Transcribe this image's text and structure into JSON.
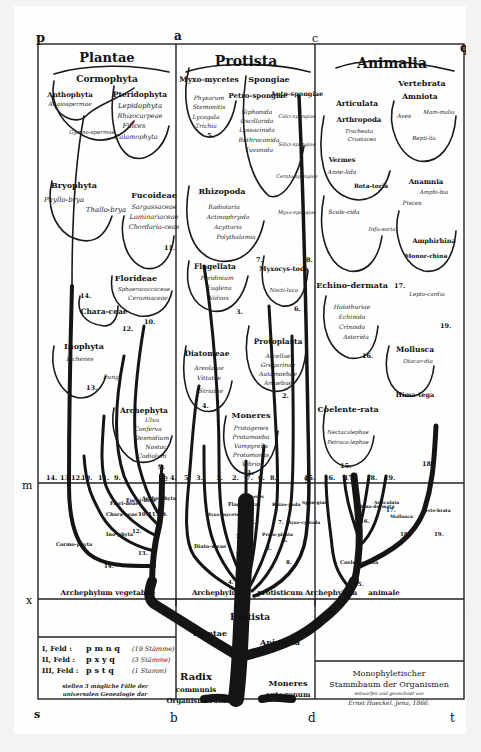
{
  "title": {
    "line1": "Monophyletischer",
    "line2": "Stammbaum der Organismen",
    "line3": "entworfen und gezeichnet von",
    "line4": "Ernst Haeckel. Jena, 1866."
  },
  "corners": {
    "p": "p",
    "a": "a",
    "c": "c",
    "q": "q",
    "m": "m",
    "e": "e",
    "g": "g",
    "n": "n",
    "x": "x",
    "f": "f",
    "h": "h",
    "y": "y",
    "s": "s",
    "b": "b",
    "d": "d",
    "t": "t"
  },
  "kingdoms": {
    "plantae": "Plantae",
    "protista": "Protista",
    "animalia": "Animalia"
  },
  "plantae_groups": {
    "cormophyta": "Cormophyta",
    "anthophyta": "Anthophyta",
    "angiospermae": "Angiospermae",
    "gymnospermae": "Gymno-spermae",
    "pteridophyta": "Pteridophyta",
    "pteridophyta_members": [
      "Lepidophyta",
      "Rhizocarpeae",
      "Filices",
      "Calamophyta"
    ],
    "bryophyta": "Bryophyta",
    "phyllobrya": "Phyllo-brya",
    "thallobrya": "Thallo-brya",
    "fucoideae": "Fucoideae",
    "fucoideae_members": [
      "Sargassaceae",
      "Laminariaceae",
      "Chordaria-ceae"
    ],
    "florideae": "Florideae",
    "florideae_members": [
      "Sphaerococcaceae",
      "Ceramiaceae"
    ],
    "characeae": "Chara-ceae",
    "inophyta": "Inophyta",
    "lichenes": "Lichenes",
    "fungi": "Fungi",
    "archephyta": "Archephyta",
    "archephyta_members": [
      "Ulva",
      "Conferva",
      "Desmidium",
      "Nostoc",
      "Codiolum"
    ]
  },
  "protista_groups": {
    "myxomycetes": "Myxo-mycetes",
    "myxomycetes_members": [
      "Physarum",
      "Stemonitis",
      "Lycogala",
      "Trichia"
    ],
    "spongiae": "Spongiae",
    "petrospongiae": "Petro-spongiae",
    "petrospongiae_members": [
      "Siphonida",
      "Oscillarida",
      "Lyssacinida",
      "Bothroconida",
      "Tuvonida"
    ],
    "autospongiae": "Auto-spongiae",
    "autospongiae_members": [
      "Calci-spongiae",
      "Silici-spongiae",
      "Cerato-spongiae",
      "Myxo-spongiae"
    ],
    "rhizopoda": "Rhizopoda",
    "rhizopoda_members": [
      "Radiolaria",
      "Actinophryida",
      "Acyttaria",
      "Polythalamia"
    ],
    "flagellata": "Flagellata",
    "flagellata_members": [
      "Peridinium",
      "Euglena",
      "Volvox"
    ],
    "myxocystoda": "Myxocys-toda",
    "myxocystoda_members": [
      "Nocti-luca"
    ],
    "diatomeae": "Diatomeae",
    "diatomeae_members": [
      "Areolatae",
      "Vittatae",
      "Striatae"
    ],
    "protoplasta": "Protoplasta",
    "protoplasta_members": [
      "Arcellae",
      "Gregarinae",
      "Autamoebae",
      "Amoebae"
    ],
    "moneres": "Moneres",
    "moneres_members": [
      "Protogenes",
      "Protamoeba",
      "Vampyrella",
      "Protomonas",
      "Vibrio"
    ]
  },
  "animalia_groups": {
    "vertebrata": "Vertebrata",
    "amniota": "Amniota",
    "aves": "Aves",
    "mammalia": "Mam-malia",
    "reptilia": "Repti-lia",
    "anamnia": "Anamnia",
    "amphibia": "Amphi-bia",
    "pisces": "Pisces",
    "amphirhina": "Amphirhina",
    "monorhina": "Monor-rhina",
    "leptocardia": "Lepto-cardia",
    "articulata": "Articulata",
    "arthropoda": "Arthropoda",
    "arthropoda_members": [
      "Tracheata",
      "Crustacea"
    ],
    "vermes": "Vermes",
    "annelida": "Anne-lida",
    "rotatoria": "Rota-toria",
    "scolecida": "Scole-cida",
    "infusoria": "Infu-soria",
    "echinodermata": "Echino-dermata",
    "echinodermata_members": [
      "Holothuriae",
      "Echinida",
      "Crinoida",
      "Asterida"
    ],
    "mollusca": "Mollusca",
    "otocardia": "Otocar-dia",
    "himatega": "Hima-tega",
    "coelenterata": "Coelente-rata",
    "coelenterata_members": [
      "Nectacalephae",
      "Petraca-lephae"
    ]
  },
  "group_numbers": {
    "myxomycetes": "5.",
    "rhizopoda": "7.",
    "spongiae": "8.",
    "flagellata": "3.",
    "myxocystoda": "6.",
    "diatomeae": "4.",
    "protoplasta": "2.",
    "moneres": "1.",
    "fucoideae": "11.",
    "florideae": "10.",
    "characeae": "12.",
    "inophyta": "13.",
    "cormophyta": "14.",
    "archephyta": "9.",
    "echinodermata": "16.",
    "articulata": "17.",
    "mollusca": "18.",
    "vertebrata": "19.",
    "coelenterata": "15."
  },
  "mn_line_numbers": [
    "14.",
    "13.",
    "12.",
    "10.",
    "11.",
    "9.",
    "4.",
    "5.",
    "3.",
    "1.",
    "2.",
    "7.",
    "6.",
    "8.",
    "15.",
    "16.",
    "17.",
    "18.",
    "19."
  ],
  "lower_field_labels": {
    "plantae": [
      "Flori-deae",
      "Fucoi-deae",
      "Arche-phyta",
      "Chara-ceae",
      "Ino-phyta",
      "Cormo-phyta"
    ],
    "plantae_nums": [
      "10.",
      "11.",
      "9.",
      "12.",
      "13.",
      "14."
    ],
    "protista": [
      "Moneres",
      "Flagel-lata",
      "Myxo-mycetes",
      "Rhizo-poda",
      "Spon-giae",
      "Myxo-cystoda",
      "Proto-plasta",
      "Diato-meae"
    ],
    "protista_nums": [
      "1.",
      "3.",
      "5.",
      "7.",
      "2.",
      "6.",
      "8.",
      "4."
    ],
    "animalia": [
      "Echino-dermata",
      "Articulata",
      "Mollusca",
      "Verte-brata",
      "Coelente-rata"
    ],
    "animalia_nums": [
      "16.",
      "17.",
      "18.",
      "19.",
      "15."
    ]
  },
  "archephyla": {
    "vegetabile": "Archephylum vegetabile",
    "protisticum_a": "Archephylum",
    "protisticum_b": "protisticum",
    "animale_a": "Archephylum",
    "animale_b": "animale"
  },
  "root": {
    "protista": "Protista",
    "plantae": "Plantae",
    "animalia": "Animalia",
    "radix1": "Radix",
    "radix2": "communis",
    "radix3": "Organismorum",
    "moneres1": "Moneres",
    "moneres2": "autogonum"
  },
  "legend": {
    "rows": [
      {
        "field": "I, Feld :",
        "letters": "p m n q",
        "count": "(19 Stämme)"
      },
      {
        "field": "II, Feld :",
        "letters": "p x y q",
        "count": "(3 Stämme)"
      },
      {
        "field": "III, Feld :",
        "letters": "p s t q",
        "count": "(1 Stamm)"
      }
    ],
    "note1": "stellen 3 mögliche Fälle der",
    "note2": "universalen Genealogie dar"
  },
  "colors": {
    "ink": "#141414",
    "paper": "#fefefe",
    "background": "#f3f3f1"
  }
}
